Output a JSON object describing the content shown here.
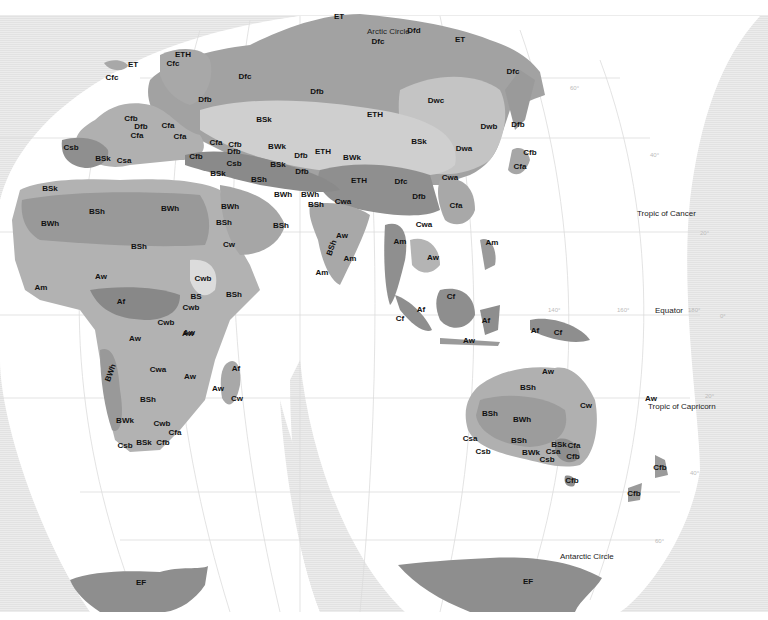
{
  "map": {
    "title": "World Köppen climate classification map (Eurasia, Africa, Oceania)",
    "projection": "interrupted equal-area",
    "colors": {
      "background_outside": "#ececec",
      "ocean": "#ffffff",
      "graticule": "#d6d6d6",
      "tropical_dark": "#8a8a8a",
      "dry": "#a9a9a9",
      "temperate": "#b8b8b8",
      "continental": "#9c9c9c",
      "light_zone": "#dcdcdc",
      "polar_ice": "#8e8e8e"
    },
    "reference_lines": {
      "arctic_circle": "Arctic Circle",
      "tropic_of_cancer": "Tropic of Cancer",
      "equator": "Equator",
      "tropic_of_capricorn": "Tropic of Capricorn",
      "antarctic_circle": "Antarctic Circle"
    },
    "degree_ticks": {
      "lat_60n": "60°",
      "lat_40n": "40°",
      "lat_20n": "20°",
      "lon_140": "140°",
      "lon_160": "160°",
      "lon_180": "180°",
      "eq_0": "0°",
      "lat_20s": "20°",
      "lat_40s": "40°",
      "lat_60s": "60°"
    },
    "labels": {
      "europe": [
        {
          "code": "ET",
          "x": 133,
          "y": 65
        },
        {
          "code": "Cfc",
          "x": 112,
          "y": 78
        },
        {
          "code": "ETH",
          "x": 183,
          "y": 55
        },
        {
          "code": "Cfc",
          "x": 173,
          "y": 64
        },
        {
          "code": "Dfc",
          "x": 245,
          "y": 77
        },
        {
          "code": "Dfb",
          "x": 205,
          "y": 100
        },
        {
          "code": "Cfb",
          "x": 131,
          "y": 119
        },
        {
          "code": "Dfb",
          "x": 141,
          "y": 127
        },
        {
          "code": "Cfa",
          "x": 168,
          "y": 126
        },
        {
          "code": "Cfa",
          "x": 137,
          "y": 136
        },
        {
          "code": "Cfa",
          "x": 180,
          "y": 137
        },
        {
          "code": "Csb",
          "x": 71,
          "y": 148
        },
        {
          "code": "BSk",
          "x": 103,
          "y": 159
        },
        {
          "code": "Csa",
          "x": 124,
          "y": 161
        },
        {
          "code": "Cfa",
          "x": 216,
          "y": 143
        },
        {
          "code": "Cfb",
          "x": 235,
          "y": 145
        },
        {
          "code": "Dfb",
          "x": 234,
          "y": 152
        },
        {
          "code": "Cfb",
          "x": 196,
          "y": 157
        },
        {
          "code": "Csb",
          "x": 234,
          "y": 164
        },
        {
          "code": "BSk",
          "x": 218,
          "y": 174
        },
        {
          "code": "BSk",
          "x": 50,
          "y": 189
        }
      ],
      "asia": [
        {
          "code": "ET",
          "x": 339,
          "y": 17
        },
        {
          "code": "Dfd",
          "x": 414,
          "y": 31
        },
        {
          "code": "Dfc",
          "x": 378,
          "y": 42
        },
        {
          "code": "ET",
          "x": 460,
          "y": 40
        },
        {
          "code": "Dfc",
          "x": 513,
          "y": 72
        },
        {
          "code": "Dfb",
          "x": 317,
          "y": 92
        },
        {
          "code": "Dwc",
          "x": 436,
          "y": 101
        },
        {
          "code": "BSk",
          "x": 264,
          "y": 120
        },
        {
          "code": "ETH",
          "x": 375,
          "y": 115
        },
        {
          "code": "Dwb",
          "x": 489,
          "y": 127
        },
        {
          "code": "Dfb",
          "x": 518,
          "y": 125
        },
        {
          "code": "BWk",
          "x": 277,
          "y": 147
        },
        {
          "code": "Dfb",
          "x": 301,
          "y": 156
        },
        {
          "code": "ETH",
          "x": 323,
          "y": 152
        },
        {
          "code": "BWk",
          "x": 352,
          "y": 158
        },
        {
          "code": "BSk",
          "x": 419,
          "y": 142
        },
        {
          "code": "Dwa",
          "x": 464,
          "y": 149
        },
        {
          "code": "Cfb",
          "x": 530,
          "y": 153
        },
        {
          "code": "BSk",
          "x": 278,
          "y": 165
        },
        {
          "code": "Dfb",
          "x": 302,
          "y": 172
        },
        {
          "code": "BSh",
          "x": 259,
          "y": 180
        },
        {
          "code": "ETH",
          "x": 359,
          "y": 181
        },
        {
          "code": "Dfc",
          "x": 401,
          "y": 182
        },
        {
          "code": "Cwa",
          "x": 450,
          "y": 178
        },
        {
          "code": "Cfa",
          "x": 520,
          "y": 167
        },
        {
          "code": "BWh",
          "x": 283,
          "y": 195
        },
        {
          "code": "BWh",
          "x": 310,
          "y": 195
        },
        {
          "code": "Dfb",
          "x": 419,
          "y": 197
        },
        {
          "code": "BSh",
          "x": 316,
          "y": 205
        },
        {
          "code": "Cwa",
          "x": 343,
          "y": 202
        },
        {
          "code": "Cfa",
          "x": 456,
          "y": 206
        },
        {
          "code": "Cwa",
          "x": 424,
          "y": 225
        },
        {
          "code": "BSh",
          "x": 281,
          "y": 226
        },
        {
          "code": "Aw",
          "x": 342,
          "y": 236
        },
        {
          "code": "Am",
          "x": 400,
          "y": 242
        },
        {
          "code": "Am",
          "x": 492,
          "y": 243
        },
        {
          "code": "BSh",
          "x": 332,
          "y": 248,
          "rotated": true
        },
        {
          "code": "Am",
          "x": 350,
          "y": 259
        },
        {
          "code": "Aw",
          "x": 433,
          "y": 258
        },
        {
          "code": "Am",
          "x": 322,
          "y": 273
        },
        {
          "code": "Cf",
          "x": 451,
          "y": 297
        },
        {
          "code": "Af",
          "x": 421,
          "y": 310
        },
        {
          "code": "Cf",
          "x": 400,
          "y": 319
        },
        {
          "code": "Af",
          "x": 486,
          "y": 321
        },
        {
          "code": "Af",
          "x": 535,
          "y": 331
        },
        {
          "code": "Aw",
          "x": 469,
          "y": 341
        },
        {
          "code": "Cf",
          "x": 558,
          "y": 333
        }
      ],
      "africa_middle_east": [
        {
          "code": "BSh",
          "x": 97,
          "y": 212
        },
        {
          "code": "BWh",
          "x": 170,
          "y": 209
        },
        {
          "code": "BWh",
          "x": 50,
          "y": 224
        },
        {
          "code": "BWh",
          "x": 230,
          "y": 207
        },
        {
          "code": "BSh",
          "x": 224,
          "y": 223
        },
        {
          "code": "BSh",
          "x": 139,
          "y": 247
        },
        {
          "code": "Cw",
          "x": 229,
          "y": 245
        },
        {
          "code": "Aw",
          "x": 101,
          "y": 277
        },
        {
          "code": "Cwb",
          "x": 203,
          "y": 279
        },
        {
          "code": "Am",
          "x": 41,
          "y": 288
        },
        {
          "code": "BSh",
          "x": 234,
          "y": 295
        },
        {
          "code": "BS",
          "x": 196,
          "y": 297
        },
        {
          "code": "Af",
          "x": 121,
          "y": 302
        },
        {
          "code": "Cwb",
          "x": 191,
          "y": 308
        },
        {
          "code": "Cwb",
          "x": 166,
          "y": 323
        },
        {
          "code": "Aw",
          "x": 188,
          "y": 334
        },
        {
          "code": "Aw",
          "x": 135,
          "y": 339
        },
        {
          "code": "Aw",
          "x": 189,
          "y": 333
        },
        {
          "code": "BWh",
          "x": 111,
          "y": 373,
          "rotated": true
        },
        {
          "code": "Cwa",
          "x": 158,
          "y": 370
        },
        {
          "code": "Aw",
          "x": 190,
          "y": 377
        },
        {
          "code": "Af",
          "x": 236,
          "y": 369
        },
        {
          "code": "Aw",
          "x": 218,
          "y": 389
        },
        {
          "code": "Cw",
          "x": 237,
          "y": 399
        },
        {
          "code": "BSh",
          "x": 148,
          "y": 400
        },
        {
          "code": "BWk",
          "x": 125,
          "y": 421
        },
        {
          "code": "Cwb",
          "x": 162,
          "y": 424
        },
        {
          "code": "Cfa",
          "x": 175,
          "y": 433
        },
        {
          "code": "Csb",
          "x": 125,
          "y": 446
        },
        {
          "code": "BSk",
          "x": 144,
          "y": 443
        },
        {
          "code": "Cfb",
          "x": 163,
          "y": 443
        }
      ],
      "oceania": [
        {
          "code": "Aw",
          "x": 548,
          "y": 372
        },
        {
          "code": "BSh",
          "x": 528,
          "y": 388
        },
        {
          "code": "Cw",
          "x": 586,
          "y": 406
        },
        {
          "code": "BSh",
          "x": 490,
          "y": 414
        },
        {
          "code": "BWh",
          "x": 522,
          "y": 420
        },
        {
          "code": "Aw",
          "x": 651,
          "y": 399
        },
        {
          "code": "Csa",
          "x": 470,
          "y": 439
        },
        {
          "code": "BSh",
          "x": 519,
          "y": 441
        },
        {
          "code": "BSk",
          "x": 559,
          "y": 445
        },
        {
          "code": "Cfa",
          "x": 574,
          "y": 446
        },
        {
          "code": "Csa",
          "x": 553,
          "y": 452
        },
        {
          "code": "Csb",
          "x": 483,
          "y": 452
        },
        {
          "code": "BWk",
          "x": 531,
          "y": 453
        },
        {
          "code": "Csb",
          "x": 547,
          "y": 460
        },
        {
          "code": "Cfb",
          "x": 573,
          "y": 457
        },
        {
          "code": "Cfb",
          "x": 572,
          "y": 481
        },
        {
          "code": "Cfb",
          "x": 660,
          "y": 468
        },
        {
          "code": "Cfb",
          "x": 634,
          "y": 494
        }
      ],
      "antarctica": [
        {
          "code": "EF",
          "x": 141,
          "y": 583
        },
        {
          "code": "EF",
          "x": 528,
          "y": 582
        }
      ]
    }
  }
}
